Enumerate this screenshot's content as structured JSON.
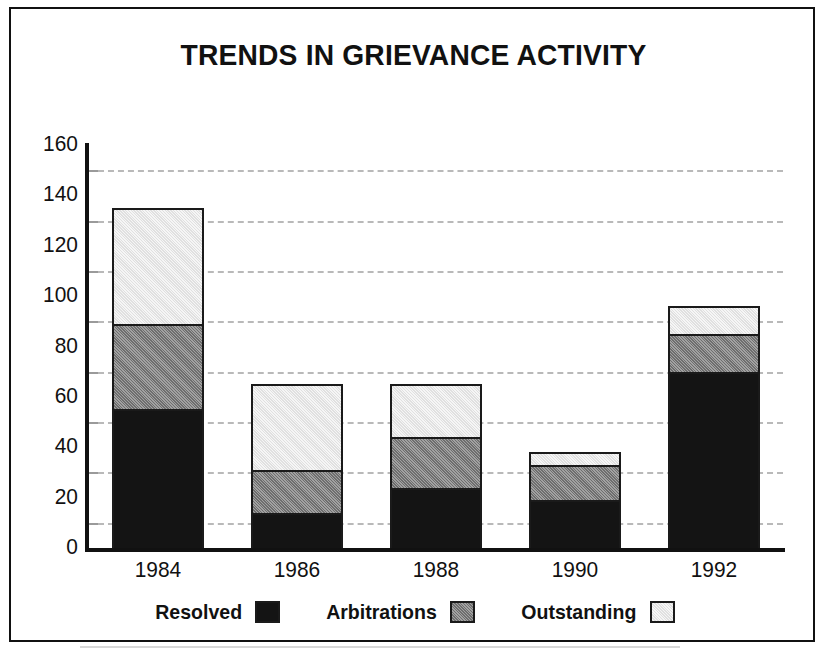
{
  "figure": {
    "title": "TRENDS IN GRIEVANCE ACTIVITY"
  },
  "chart_data": {
    "type": "bar",
    "stacked": true,
    "title": "TRENDS IN GRIEVANCE ACTIVITY",
    "xlabel": "",
    "ylabel": "",
    "categories": [
      "1984",
      "1986",
      "1988",
      "1990",
      "1992"
    ],
    "series": [
      {
        "name": "Resolved",
        "color": "#141414",
        "values": [
          55,
          14,
          24,
          19,
          70
        ]
      },
      {
        "name": "Arbitrations",
        "color": "#8d8d8d",
        "values": [
          34,
          17,
          20,
          14,
          15
        ]
      },
      {
        "name": "Outstanding",
        "color": "#ececec",
        "values": [
          46,
          34,
          21,
          5,
          11
        ]
      }
    ],
    "totals": [
      135,
      65,
      65,
      38,
      96
    ],
    "ylim": [
      0,
      160
    ],
    "ytick_labels": [
      "0",
      "20",
      "40",
      "60",
      "80",
      "100",
      "120",
      "140",
      "160"
    ],
    "ytick_values": [
      0,
      20,
      40,
      60,
      80,
      100,
      120,
      140,
      160
    ],
    "gridline_values": [
      10,
      30,
      50,
      70,
      90,
      110,
      130,
      150
    ],
    "grid": true,
    "grid_style": "dashed",
    "legend_position": "bottom",
    "legend_entries": [
      "Resolved",
      "Arbitrations",
      "Outstanding"
    ]
  }
}
